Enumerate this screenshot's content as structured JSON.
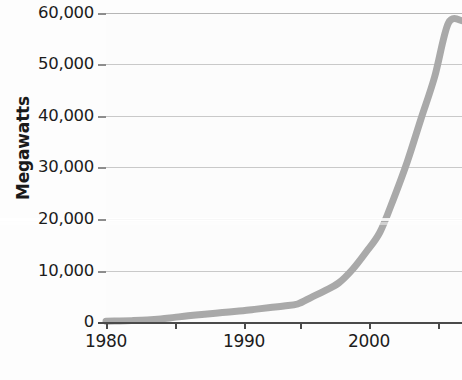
{
  "chart_data": {
    "type": "line",
    "title": "",
    "title_note": "title row is cropped off the top edge of the screenshot; only descenders are visible",
    "xlabel": "",
    "ylabel": "Megawatts",
    "xlim": [
      1980,
      2006
    ],
    "ylim": [
      0,
      60000
    ],
    "yticks": [
      0,
      10000,
      20000,
      30000,
      40000,
      50000,
      60000
    ],
    "ytick_labels": [
      "0",
      "10,000",
      "20,000",
      "30,000",
      "40,000",
      "50,000",
      "60,000"
    ],
    "xticks": [
      1980,
      1985,
      1990,
      1995,
      2000,
      2005
    ],
    "xtick_labels": [
      "1980",
      "",
      "1990",
      "",
      "2000",
      ""
    ],
    "xtick_labels_shown": [
      "1980",
      "1990",
      "2000"
    ],
    "grid": true,
    "grid_axis": "y",
    "legend": "none",
    "series": [
      {
        "name": "Global installed wind capacity",
        "color": "#a9a9a9",
        "line_width": 7,
        "x": [
          1980,
          1981,
          1982,
          1983,
          1984,
          1985,
          1986,
          1987,
          1988,
          1989,
          1990,
          1991,
          1992,
          1993,
          1994,
          1995,
          1996,
          1997,
          1998,
          1999,
          2000,
          2001,
          2002,
          2003,
          2004,
          2005,
          2006
        ],
        "values": [
          150,
          200,
          280,
          400,
          600,
          900,
          1200,
          1450,
          1700,
          1950,
          2200,
          2500,
          2800,
          3100,
          3500,
          4800,
          6100,
          7600,
          10200,
          13600,
          17400,
          23900,
          31100,
          39400,
          47600,
          58000,
          58500
        ]
      }
    ]
  },
  "axes": {
    "y_title": "Megawatts",
    "y_tick_labels": [
      "60,000",
      "50,000",
      "40,000",
      "30,000",
      "20,000",
      "10,000",
      "0"
    ],
    "x_tick_labels": [
      "1980",
      "1990",
      "2000"
    ]
  },
  "colors": {
    "series": "#a9a9a9",
    "gridline": "#c9c9c9",
    "axis": "#4a4a4a",
    "text": "#1c1c1c",
    "plot_background": "#fcfcfc",
    "page_background": "#fdfdfd"
  }
}
